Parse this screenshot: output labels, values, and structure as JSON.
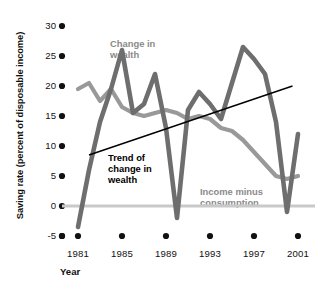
{
  "chart_data": {
    "type": "line",
    "title": "",
    "subtitle": "",
    "xlabel": "Year",
    "ylabel": "Saving rate (percent of disposable income)",
    "xlim": [
      1980,
      2002
    ],
    "ylim": [
      -5,
      30
    ],
    "grid": false,
    "legend_position": "inline-annotations",
    "xticks": [
      1981,
      1985,
      1989,
      1993,
      1997,
      2001
    ],
    "xticklabels": [
      "1981",
      "1985",
      "1989",
      "1993",
      "1997",
      "2001"
    ],
    "yticks": [
      -5,
      0,
      5,
      10,
      15,
      20,
      25,
      30
    ],
    "yticklabels": [
      "-5",
      "0",
      "5",
      "10",
      "15",
      "20",
      "25",
      "30"
    ],
    "zero_line": 0,
    "x": [
      1981,
      1982,
      1983,
      1984,
      1985,
      1986,
      1987,
      1988,
      1989,
      1990,
      1991,
      1992,
      1993,
      1994,
      1995,
      1996,
      1997,
      1998,
      1999,
      2000,
      2001
    ],
    "series": [
      {
        "name": "Change in wealth",
        "color": "#6e6e6e",
        "values": [
          -3.5,
          6.0,
          14.0,
          19.5,
          26.0,
          15.5,
          17.0,
          22.0,
          13.0,
          -2.0,
          16.0,
          19.0,
          17.0,
          14.5,
          20.5,
          26.5,
          24.5,
          22.0,
          14.0,
          -1.0,
          12.0
        ]
      },
      {
        "name": "Income minus consumption",
        "color": "#999999",
        "values": [
          19.5,
          20.5,
          17.5,
          19.5,
          16.5,
          15.5,
          15.0,
          15.5,
          16.0,
          15.5,
          14.5,
          15.0,
          14.5,
          13.0,
          12.5,
          11.0,
          9.0,
          7.0,
          5.0,
          4.5,
          5.0
        ]
      }
    ],
    "annotations": [
      {
        "name": "Trend of change in wealth",
        "type": "trendline",
        "x0": 1982.0,
        "y0": 8.5,
        "x1": 2000.5,
        "y1": 20.0,
        "color": "#000000"
      },
      {
        "name": "Change in wealth",
        "type": "label",
        "text": "Change in\nwealth"
      },
      {
        "name": "Income minus consumption",
        "type": "label",
        "text": "Income minus\nconsumption"
      },
      {
        "name": "Trend of change in wealth",
        "type": "label",
        "text": "Trend of\nchange in\nwealth"
      }
    ]
  },
  "labels": {
    "y_axis_title": "Saving rate (percent of disposable income)",
    "x_axis_title": "Year",
    "change_in_wealth_line1": "Change in",
    "change_in_wealth_line2": "wealth",
    "trend_line1": "Trend of",
    "trend_line2": "change in",
    "trend_line3": "wealth",
    "income_line1": "Income minus",
    "income_line2": "consumption"
  },
  "yticklabels": {
    "t30": "30",
    "t25": "25",
    "t20": "20",
    "t15": "15",
    "t10": "10",
    "t5": "5",
    "t0": "0",
    "tm5": "-5"
  },
  "xticklabels": {
    "x1981": "1981",
    "x1985": "1985",
    "x1989": "1989",
    "x1993": "1993",
    "x1997": "1997",
    "x2001": "2001"
  },
  "colors": {
    "change_in_wealth": "#6e6e6e",
    "income_minus_consumption": "#999999",
    "trend": "#000000",
    "zero_line": "#c9c9c9",
    "tick_dot": "#111111"
  }
}
